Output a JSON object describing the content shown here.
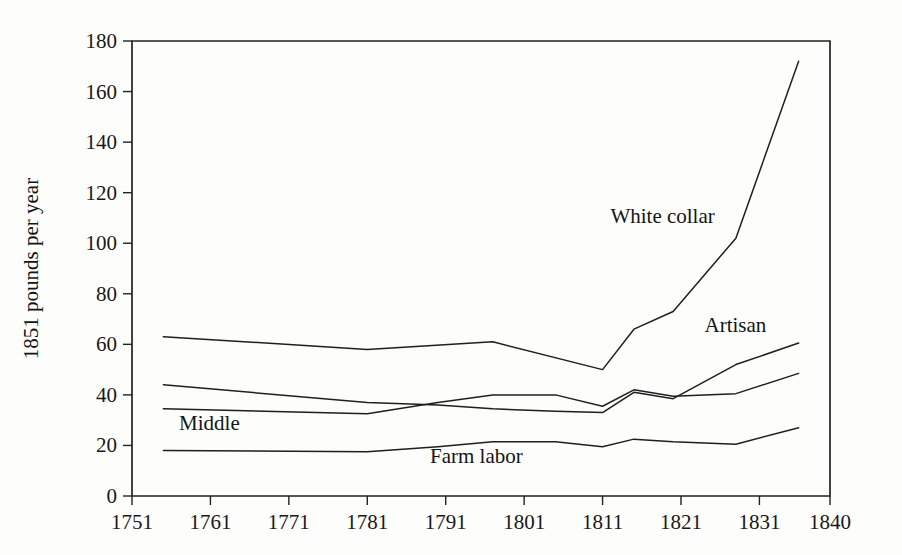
{
  "chart_data": {
    "type": "line",
    "title": "",
    "subtitle": "",
    "xlabel": "",
    "ylabel": "1851 pounds per year",
    "xlim": [
      1751,
      1840
    ],
    "ylim": [
      0,
      180
    ],
    "grid": false,
    "legend_position": "inline-annotations",
    "x_ticks": [
      "1751",
      "1761",
      "1771",
      "1781",
      "1791",
      "1801",
      "1811",
      "1821",
      "1831",
      "1840"
    ],
    "x_tick_values": [
      1751,
      1761,
      1771,
      1781,
      1791,
      1801,
      1811,
      1821,
      1831,
      1840
    ],
    "y_ticks": [
      "0",
      "20",
      "40",
      "60",
      "80",
      "100",
      "120",
      "140",
      "160",
      "180"
    ],
    "y_tick_values": [
      0,
      20,
      40,
      60,
      80,
      100,
      120,
      140,
      160,
      180
    ],
    "series": [
      {
        "name": "White collar",
        "label": "White collar",
        "label_x": 1812,
        "label_y": 108,
        "x": [
          1755,
          1781,
          1797,
          1811,
          1815,
          1820,
          1828,
          1836
        ],
        "values": [
          63,
          58,
          61,
          50,
          66,
          73,
          102,
          172
        ]
      },
      {
        "name": "Artisan",
        "label": "Artisan",
        "label_x": 1824,
        "label_y": 65,
        "x": [
          1755,
          1781,
          1790,
          1797,
          1805,
          1811,
          1815,
          1820,
          1828,
          1836
        ],
        "values": [
          44,
          37,
          36,
          34.5,
          33.5,
          33,
          41,
          38.5,
          52,
          60.5
        ]
      },
      {
        "name": "Middle",
        "label": "Middle",
        "label_x": 1757,
        "label_y": 26,
        "x": [
          1755,
          1781,
          1790,
          1797,
          1805,
          1811,
          1815,
          1820,
          1828,
          1836
        ],
        "values": [
          34.5,
          32.5,
          37,
          40,
          40,
          35.5,
          42,
          39.5,
          40.5,
          48.5
        ]
      },
      {
        "name": "Farm labor",
        "label": "Farm labor",
        "label_x": 1789,
        "label_y": 13,
        "x": [
          1755,
          1781,
          1790,
          1797,
          1805,
          1811,
          1815,
          1820,
          1828,
          1836
        ],
        "values": [
          18,
          17.5,
          19.5,
          21.5,
          21.5,
          19.5,
          22.5,
          21.5,
          20.5,
          27
        ]
      }
    ]
  }
}
